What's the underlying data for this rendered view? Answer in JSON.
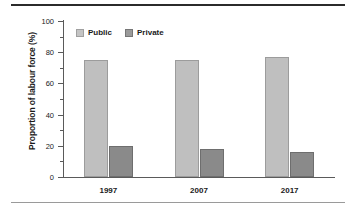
{
  "chart_data": {
    "type": "bar",
    "title": "",
    "xlabel": "",
    "ylabel": "Proportion of labour force (%)",
    "categories": [
      "1997",
      "2007",
      "2017"
    ],
    "series": [
      {
        "name": "Public",
        "color": "#bfbfbf",
        "values": [
          75,
          75,
          77
        ]
      },
      {
        "name": "Private",
        "color": "#8a8a8a",
        "values": [
          20,
          18,
          16
        ]
      }
    ],
    "ylim": [
      0,
      100
    ],
    "yticks": [
      0,
      20,
      40,
      60,
      80,
      100
    ],
    "ytick_labels": [
      "0",
      "20",
      "40",
      "60",
      "80",
      "100"
    ],
    "yminor_ticks": [
      10,
      30,
      50,
      70,
      90
    ],
    "grid": false,
    "legend_position": "top-left",
    "legend": [
      "Public",
      "Private"
    ]
  },
  "figure": {
    "rule_top_color": "#2b2b2b",
    "rule_bottom_color": "#9a9a9a"
  }
}
